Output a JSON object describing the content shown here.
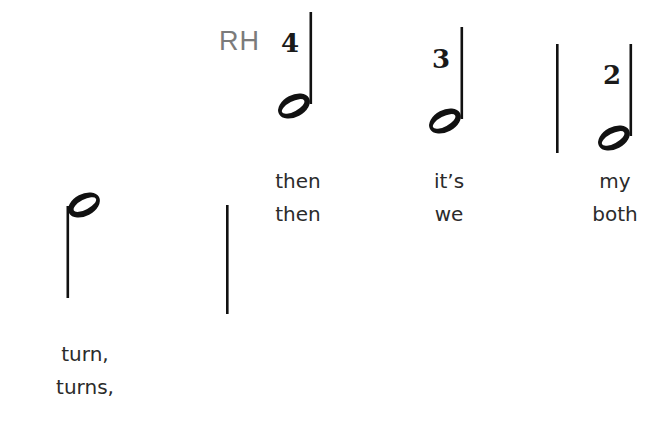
{
  "hand_label": "RH",
  "notes": [
    {
      "id": "note-1",
      "type": "half-note",
      "stem": "down",
      "finger": "",
      "lyrics": [
        "turn,",
        "turns,"
      ]
    },
    {
      "id": "note-2",
      "type": "half-note",
      "stem": "up",
      "finger": "4",
      "lyrics": [
        "then",
        "then"
      ]
    },
    {
      "id": "note-3",
      "type": "half-note",
      "stem": "up",
      "finger": "3",
      "lyrics": [
        "it’s",
        "we"
      ]
    },
    {
      "id": "note-4",
      "type": "half-note",
      "stem": "up",
      "finger": "2",
      "lyrics": [
        "my",
        "both"
      ]
    }
  ],
  "barlines": [
    {
      "id": "barline-1",
      "position": "after-note-1"
    },
    {
      "id": "barline-2",
      "position": "after-note-3"
    }
  ],
  "colors": {
    "ink": "#111111",
    "label_gray": "#7b7b7b",
    "lyric_text": "#2b2b2b"
  }
}
